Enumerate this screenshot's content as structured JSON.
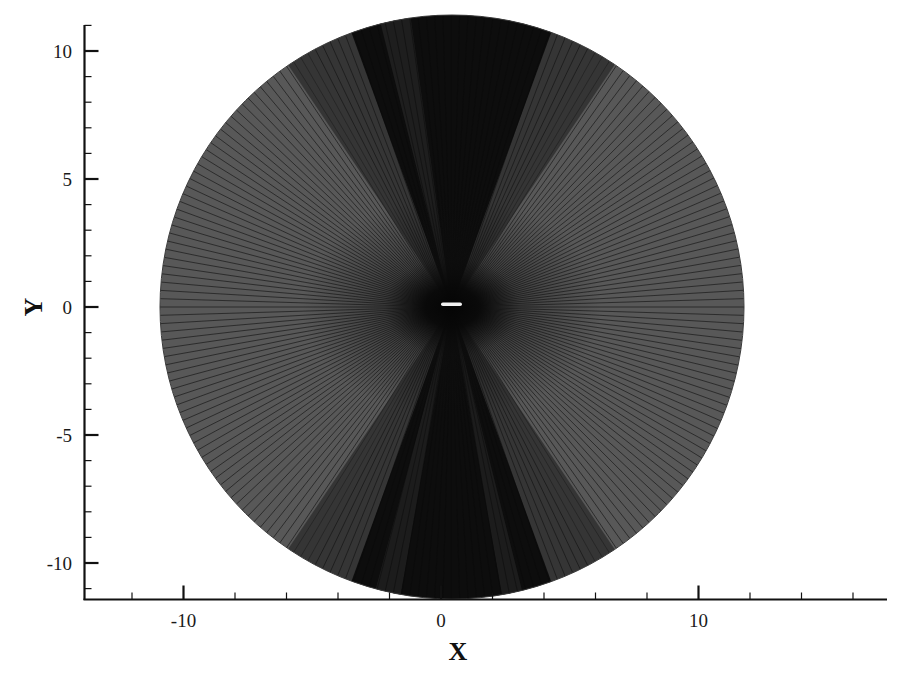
{
  "chart_data": {
    "type": "mesh",
    "title": "",
    "xlabel": "X",
    "ylabel": "Y",
    "xlim": [
      -13.9,
      17.4
    ],
    "ylim": [
      -11.1,
      11.1
    ],
    "x_major_ticks": [
      -10,
      0,
      10
    ],
    "x_major_tick_labels": [
      "-10",
      "0",
      "10"
    ],
    "x_minor_step": 2,
    "y_major_ticks": [
      -10,
      -5,
      0,
      5,
      10
    ],
    "y_major_tick_labels": [
      "-10",
      "-5",
      "0",
      "5",
      "10"
    ],
    "y_minor_step": 1,
    "grid": false,
    "legend": null,
    "domain_shape": {
      "type": "circle",
      "center": [
        0.4,
        0.0
      ],
      "radius": 11.4,
      "fill_color": "#505050",
      "line_color": "#1c1c1c",
      "description": "Radial (O-type) computational grid around an airfoil; radial grid lines fan out from the airfoil; dark dense regions above and below the airfoil"
    },
    "airfoil": {
      "chord_start_x": 0.0,
      "chord_end_x": 0.8,
      "y": 0.1,
      "color": "#f0f0f0"
    },
    "dark_bands": [
      {
        "name": "upper-wake-band",
        "angle_range_deg": [
          70,
          110
        ]
      },
      {
        "name": "lower-wake-band",
        "angle_range_deg": [
          250,
          290
        ]
      }
    ]
  },
  "colors": {
    "background": "#ffffff",
    "axis": "#111111",
    "mesh_fill": "#555555",
    "mesh_dark": "#0c0c0c",
    "mesh_line": "#222222",
    "airfoil": "#f2f2f2"
  }
}
